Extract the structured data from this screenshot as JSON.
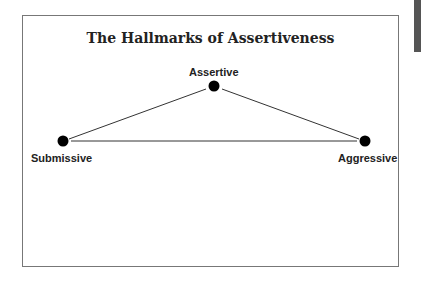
{
  "title": "The Hallmarks of Assertiveness",
  "nodes": [
    {
      "id": "assertive",
      "label": "Assertive",
      "x": 214,
      "y": 86
    },
    {
      "id": "submissive",
      "label": "Submissive",
      "x": 63,
      "y": 141
    },
    {
      "id": "aggressive",
      "label": "Aggressive",
      "x": 365,
      "y": 141
    }
  ],
  "edges": [
    [
      "submissive",
      "assertive"
    ],
    [
      "assertive",
      "aggressive"
    ],
    [
      "submissive",
      "aggressive"
    ]
  ]
}
